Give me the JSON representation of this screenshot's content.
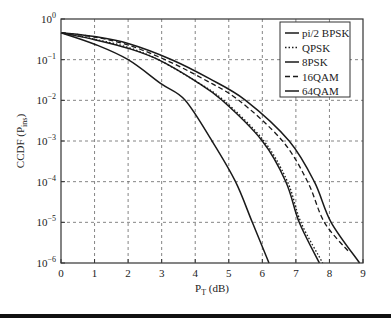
{
  "chart_data": {
    "type": "line",
    "title": "",
    "xlabel": "P_T (dB)",
    "xlabel_main": "P",
    "xlabel_sub": "T",
    "xlabel_unit": " (dB)",
    "ylabel": "CCDF (P_ins)",
    "ylabel_main": "CCDF (P",
    "ylabel_sub": "ins",
    "ylabel_close": ")",
    "xlim": [
      0,
      9
    ],
    "ylim": [
      1e-06,
      1
    ],
    "yscale": "log",
    "grid": true,
    "legend_position": "upper right",
    "x_ticks": [
      "0",
      "1",
      "2",
      "3",
      "4",
      "5",
      "6",
      "7",
      "8",
      "9"
    ],
    "y_ticks": [
      {
        "base": "10",
        "exp": "0"
      },
      {
        "base": "10",
        "exp": "−1"
      },
      {
        "base": "10",
        "exp": "−2"
      },
      {
        "base": "10",
        "exp": "−3"
      },
      {
        "base": "10",
        "exp": "−4"
      },
      {
        "base": "10",
        "exp": "−5"
      },
      {
        "base": "10",
        "exp": "−6"
      }
    ],
    "series": [
      {
        "name": "pi/2 BPSK",
        "style": "solid",
        "x": [
          0,
          1.0,
          2.0,
          3.0,
          3.7,
          4.5,
          5.2,
          5.7,
          6.2
        ],
        "y": [
          0.46,
          0.24,
          0.1,
          0.025,
          0.01,
          0.001,
          0.0001,
          1e-05,
          1e-06
        ]
      },
      {
        "name": "QPSK",
        "style": "dotted",
        "x": [
          0,
          1.0,
          2.0,
          2.9,
          4.0,
          4.85,
          6.05,
          6.75,
          7.15,
          7.8
        ],
        "y": [
          0.46,
          0.32,
          0.2,
          0.1,
          0.03,
          0.01,
          0.001,
          0.0001,
          1e-05,
          1e-06
        ]
      },
      {
        "name": "8PSK",
        "style": "solid",
        "x": [
          0,
          1.0,
          2.0,
          2.9,
          4.0,
          4.8,
          6.0,
          6.7,
          7.1,
          7.7
        ],
        "y": [
          0.46,
          0.31,
          0.19,
          0.1,
          0.03,
          0.01,
          0.001,
          0.0001,
          1e-05,
          1e-06
        ]
      },
      {
        "name": "16QAM",
        "style": "dashed",
        "x": [
          0,
          1.0,
          2.0,
          3.1,
          4.2,
          5.3,
          6.6,
          7.35,
          7.85,
          8.6
        ],
        "y": [
          0.46,
          0.36,
          0.23,
          0.1,
          0.035,
          0.01,
          0.001,
          0.0001,
          1e-05,
          1.8e-06
        ]
      },
      {
        "name": "64QAM",
        "style": "solid",
        "x": [
          0,
          1.0,
          2.0,
          3.3,
          4.4,
          5.5,
          6.8,
          7.55,
          8.05,
          8.9
        ],
        "y": [
          0.46,
          0.37,
          0.25,
          0.1,
          0.035,
          0.01,
          0.001,
          0.0001,
          1e-05,
          1e-06
        ]
      }
    ]
  }
}
